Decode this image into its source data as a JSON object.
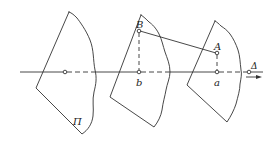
{
  "figure": {
    "width": 278,
    "height": 142,
    "stroke_color": "#333333",
    "background": "#ffffff",
    "labels": {
      "plane": "Π",
      "point_upper_B": "B",
      "point_lower_b": "b",
      "point_upper_A": "A",
      "point_lower_a": "a",
      "axis": "Δ"
    }
  }
}
